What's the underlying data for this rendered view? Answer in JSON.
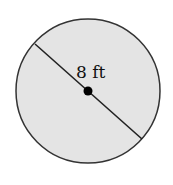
{
  "diagram": {
    "shape": "circle",
    "fill_color": "#e4e4e4",
    "stroke_color": "#333333",
    "center_point_color": "#000000",
    "diameter_label": "8 ft"
  }
}
